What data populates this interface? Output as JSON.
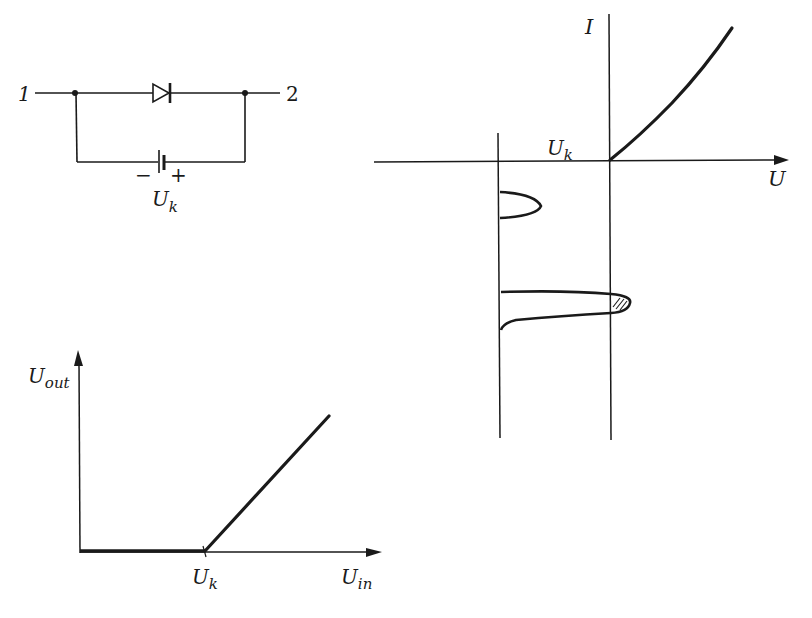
{
  "circuit": {
    "terminal_left": "1",
    "terminal_right": "2",
    "battery_minus": "−",
    "battery_plus": "+",
    "battery_label_main": "U",
    "battery_label_sub": "k"
  },
  "iv_chart": {
    "y_axis_label": "I",
    "x_axis_label": "U",
    "threshold_label_main": "U",
    "threshold_label_sub": "k"
  },
  "transfer_chart": {
    "y_axis_label_main": "U",
    "y_axis_label_sub": "out",
    "x_axis_label_main": "U",
    "x_axis_label_sub": "in",
    "knee_label_main": "U",
    "knee_label_sub": "k"
  },
  "colors": {
    "ink": "#1a1a1a",
    "background": "#ffffff"
  }
}
